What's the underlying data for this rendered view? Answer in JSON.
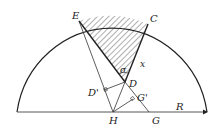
{
  "diagram": {
    "type": "geometry",
    "labels": {
      "E": "E",
      "C": "C",
      "x": "x",
      "sigma": "σ",
      "D": "D",
      "D_prime": "D'",
      "G_prime": "G'",
      "H": "H",
      "G": "G",
      "R": "R"
    },
    "points": {
      "E": [
        79,
        21
      ],
      "C": [
        148,
        24
      ],
      "D": [
        125,
        82
      ],
      "H": [
        113,
        112
      ],
      "G": [
        149,
        112
      ],
      "D_prime": [
        104,
        90
      ],
      "G_prime": [
        133,
        99
      ]
    },
    "colors": {
      "stroke": "#222222",
      "hatch": "#333333",
      "background": "#ffffff"
    }
  }
}
